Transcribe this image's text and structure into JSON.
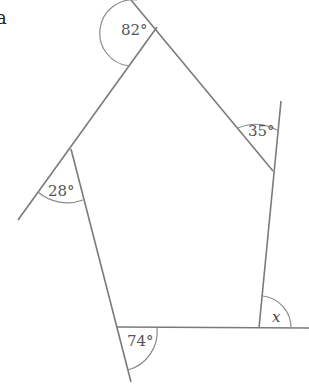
{
  "figure": {
    "corner_letter": "a",
    "shape": "pentagon",
    "angles": [
      {
        "label": "82°",
        "vertex": "top"
      },
      {
        "label": "35°",
        "vertex": "right-upper"
      },
      {
        "label": "28°",
        "vertex": "left"
      },
      {
        "label": "74°",
        "vertex": "bottom-left"
      },
      {
        "label": "x",
        "vertex": "bottom-right"
      }
    ],
    "colors": {
      "line": "#7a7a7a",
      "text": "#555555"
    }
  }
}
